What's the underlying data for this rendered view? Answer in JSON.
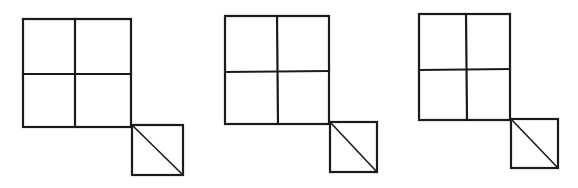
{
  "figures": [
    {
      "id": "figure-1",
      "grid": {
        "left": 23,
        "top": 19,
        "midx": 75,
        "midy": 74,
        "right": 131,
        "bottom": 127
      },
      "small_square": {
        "left": 132,
        "top": 125,
        "right": 183,
        "bottom": 175
      },
      "diagonal": "top-left-to-bottom-right"
    },
    {
      "id": "figure-2",
      "grid": {
        "left": 225,
        "top": 16,
        "midx": 277,
        "midy": 72,
        "right": 329,
        "bottom": 124
      },
      "small_square": {
        "left": 330,
        "top": 122,
        "right": 377,
        "bottom": 172
      },
      "diagonal": "top-left-to-bottom-right"
    },
    {
      "id": "figure-3",
      "grid": {
        "left": 419,
        "top": 14,
        "midx": 466,
        "midy": 70,
        "right": 510,
        "bottom": 120
      },
      "small_square": {
        "left": 512,
        "top": 119,
        "right": 558,
        "bottom": 168
      },
      "diagonal": "top-left-to-bottom-right"
    }
  ],
  "colors": {
    "line": "#1a1a1a",
    "background": "#ffffff"
  }
}
